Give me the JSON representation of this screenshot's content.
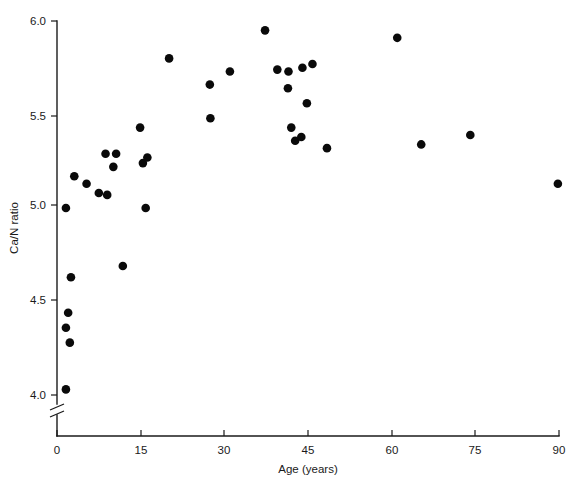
{
  "chart_data": {
    "type": "scatter",
    "title": "",
    "xlabel": "Age (years)",
    "ylabel": "Ca/N ratio",
    "xlim": [
      0,
      90
    ],
    "ylim": [
      3.93,
      6.0
    ],
    "xticks": [
      0,
      15,
      30,
      45,
      60,
      75,
      90
    ],
    "xtick_labels": [
      "0",
      "15",
      "30",
      "45",
      "60",
      "75",
      "90"
    ],
    "yticks": [
      4.0,
      4.5,
      5.0,
      5.5,
      6.0
    ],
    "ytick_labels": [
      "4.0",
      "4.5",
      "5.0",
      "5.5",
      "6.0"
    ],
    "grid": false,
    "legend": null,
    "axis_break": {
      "axis": "y",
      "below_value": 4.0,
      "description": "double slash break between baseline and 4.0 tick"
    },
    "marker": {
      "shape": "circle",
      "color": "#0a0a0a",
      "radius_px": 4.3
    },
    "points": [
      {
        "x": 1.6,
        "y": 4.03
      },
      {
        "x": 2.3,
        "y": 4.28
      },
      {
        "x": 1.6,
        "y": 4.36
      },
      {
        "x": 2.0,
        "y": 4.44
      },
      {
        "x": 2.5,
        "y": 4.63
      },
      {
        "x": 1.6,
        "y": 5.0
      },
      {
        "x": 3.1,
        "y": 5.17
      },
      {
        "x": 5.3,
        "y": 5.13
      },
      {
        "x": 7.5,
        "y": 5.08
      },
      {
        "x": 8.7,
        "y": 5.29
      },
      {
        "x": 10.6,
        "y": 5.29
      },
      {
        "x": 9.0,
        "y": 5.07
      },
      {
        "x": 10.1,
        "y": 5.22
      },
      {
        "x": 11.8,
        "y": 4.69
      },
      {
        "x": 14.9,
        "y": 5.43
      },
      {
        "x": 15.4,
        "y": 5.24
      },
      {
        "x": 16.2,
        "y": 5.27
      },
      {
        "x": 15.9,
        "y": 5.0
      },
      {
        "x": 20.1,
        "y": 5.8
      },
      {
        "x": 27.4,
        "y": 5.66
      },
      {
        "x": 27.5,
        "y": 5.48
      },
      {
        "x": 31.0,
        "y": 5.73
      },
      {
        "x": 37.3,
        "y": 5.95
      },
      {
        "x": 39.5,
        "y": 5.74
      },
      {
        "x": 41.5,
        "y": 5.73
      },
      {
        "x": 41.4,
        "y": 5.64
      },
      {
        "x": 42.0,
        "y": 5.43
      },
      {
        "x": 42.7,
        "y": 5.36
      },
      {
        "x": 43.8,
        "y": 5.38
      },
      {
        "x": 44.0,
        "y": 5.75
      },
      {
        "x": 45.8,
        "y": 5.77
      },
      {
        "x": 44.8,
        "y": 5.56
      },
      {
        "x": 48.4,
        "y": 5.32
      },
      {
        "x": 61.0,
        "y": 5.91
      },
      {
        "x": 65.3,
        "y": 5.34
      },
      {
        "x": 74.1,
        "y": 5.39
      },
      {
        "x": 89.8,
        "y": 5.13
      }
    ]
  },
  "axes": {
    "x_axis_name": "age-axis",
    "y_axis_name": "ca-n-ratio-axis"
  }
}
